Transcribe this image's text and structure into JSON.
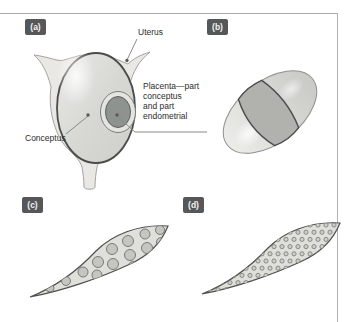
{
  "figure": {
    "panel_labels": {
      "a": "(a)",
      "b": "(b)",
      "c": "(c)",
      "d": "(d)"
    },
    "annotations": {
      "uterus": "Uterus",
      "placenta": "Placenta—part\nconceptus\nand part\nendometrial",
      "conceptus": "Conceptus"
    },
    "colors": {
      "panel_label_bg": "#565759",
      "panel_label_text": "#f2f2f2",
      "uterus_tissue_fill": "#e9e8e4",
      "conceptus_fill": "#d7d7d4",
      "placenta_ring_fill": "#e4e4e1",
      "placenta_core_fill": "#8f938f",
      "zonary_band_fill": "#b1b2ae",
      "spindle_fill": "#e0e0db",
      "cotyledon_fill": "#c5c6c2",
      "microcotyledon_fill": "#cdcec9",
      "outline_dark": "#4c4c4a",
      "leader_line": "#8a8a88",
      "frame_border": "#a8a8a8"
    }
  }
}
